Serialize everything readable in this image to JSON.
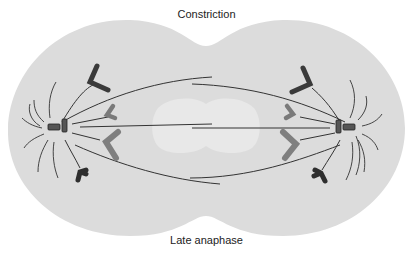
{
  "diagram": {
    "title": "Late anaphase",
    "labels": {
      "top": "Constriction",
      "bottom": "Late anaphase"
    },
    "colors": {
      "cell": "#dcdcdc",
      "cell_center": "#e8e8e8",
      "chromosome_dark": "#3a3a3a",
      "chromosome_mid": "#6e6e6e",
      "chromosome_light": "#7f7f7f",
      "fiber": "#333333"
    },
    "structures": [
      {
        "name": "left-centrosome",
        "side": "left"
      },
      {
        "name": "right-centrosome",
        "side": "right"
      },
      {
        "name": "chromosomes",
        "count_per_side": 4
      },
      {
        "name": "spindle-fibers",
        "type": "polar and kinetochore microtubules"
      },
      {
        "name": "astral-microtubules",
        "side": "both poles"
      },
      {
        "name": "cleavage-furrow",
        "label": "Constriction"
      }
    ]
  }
}
